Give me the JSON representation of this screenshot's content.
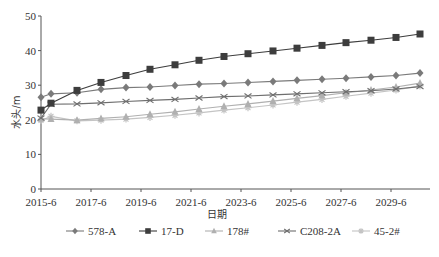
{
  "chart_data": {
    "type": "line",
    "title": "",
    "xlabel": "日期",
    "ylabel": "水头/m",
    "ylim": [
      0,
      50
    ],
    "yticks": [
      0,
      10,
      20,
      30,
      40,
      50
    ],
    "xtick_labels": [
      "2015-6",
      "2017-6",
      "2019-6",
      "2021-6",
      "2023-6",
      "2025-6",
      "2027-6",
      "2029-6"
    ],
    "grid": false,
    "legend_position": "bottom",
    "x": [
      "2015-6",
      "2016-1",
      "2017-1",
      "2018-1",
      "2019-1",
      "2020-1",
      "2021-1",
      "2022-1",
      "2023-1",
      "2024-1",
      "2025-1",
      "2026-1",
      "2027-1",
      "2028-1",
      "2029-1",
      "2030-1",
      "2031-1"
    ],
    "x_px": [
      41,
      51,
      77,
      101,
      126,
      150,
      175,
      199,
      224,
      248,
      273,
      297,
      322,
      346,
      371,
      396,
      420
    ],
    "series": [
      {
        "name": "578-A",
        "marker": "diamond",
        "color": "#7a7a7a",
        "values": [
          26.5,
          27.5,
          27.8,
          28.8,
          29.3,
          29.5,
          29.9,
          30.3,
          30.5,
          30.8,
          31.1,
          31.4,
          31.7,
          32.0,
          32.4,
          32.8,
          33.5
        ]
      },
      {
        "name": "17-D",
        "marker": "square",
        "color": "#3d3d3d",
        "values": [
          22.8,
          24.8,
          28.5,
          30.8,
          32.8,
          34.6,
          35.9,
          37.2,
          38.3,
          39.1,
          39.9,
          40.7,
          41.5,
          42.3,
          43.0,
          43.8,
          44.8
        ]
      },
      {
        "name": "178#",
        "marker": "triangle",
        "color": "#b0b0b0",
        "values": [
          20.3,
          20.2,
          19.9,
          20.4,
          20.9,
          21.6,
          22.3,
          23.1,
          23.9,
          24.6,
          25.4,
          26.2,
          27.0,
          27.8,
          28.6,
          29.5,
          30.6
        ]
      },
      {
        "name": "C208-2A",
        "marker": "x",
        "color": "#6e6e6e",
        "values": [
          20.5,
          24.5,
          24.6,
          24.9,
          25.3,
          25.6,
          25.9,
          26.3,
          26.7,
          26.9,
          27.2,
          27.5,
          27.8,
          28.1,
          28.4,
          28.9,
          29.6
        ]
      },
      {
        "name": "45-2#",
        "marker": "star",
        "color": "#c4c4c4",
        "values": [
          19.8,
          21.0,
          19.7,
          19.9,
          20.2,
          20.7,
          21.3,
          22.0,
          22.8,
          23.5,
          24.3,
          25.1,
          25.9,
          26.8,
          27.7,
          28.6,
          29.8
        ]
      }
    ]
  },
  "axes": {
    "x_title": "日期",
    "y_title": "水头/m"
  },
  "legend": {
    "items": [
      "578-A",
      "17-D",
      "178#",
      "C208-2A",
      "45-2#"
    ]
  }
}
